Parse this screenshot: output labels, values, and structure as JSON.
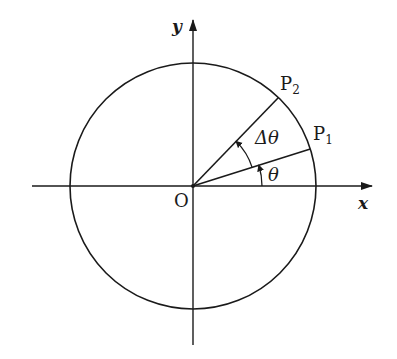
{
  "diagram": {
    "type": "unit-circle-angle",
    "labels": {
      "origin": "O",
      "x_axis": "x",
      "y_axis": "y",
      "p1": "P",
      "p1_sub": "1",
      "p2": "P",
      "p2_sub": "2",
      "theta": "θ",
      "delta_theta": "Δθ"
    },
    "colors": {
      "stroke": "#1a1a1a",
      "background": "#ffffff"
    }
  }
}
